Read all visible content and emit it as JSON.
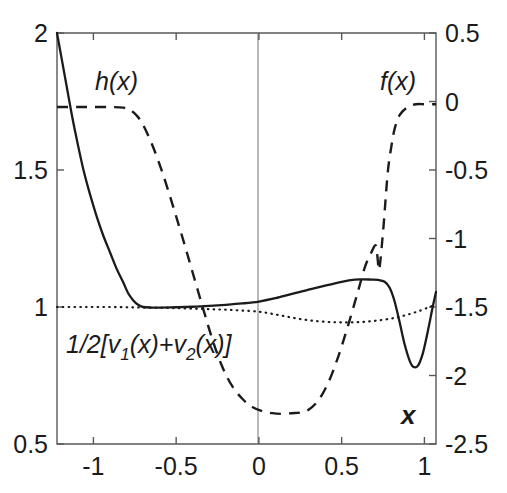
{
  "figure": {
    "background_color": "#ffffff",
    "line_color": "#1b1b1b",
    "axis_color": "#58585a",
    "width": 507,
    "height": 493
  },
  "axes": {
    "x_label": "x",
    "x_ticks": [
      "-1",
      "-0.5",
      "0",
      "0.5",
      "1"
    ],
    "x_tick_values": [
      -1,
      -0.5,
      0,
      0.5,
      1
    ],
    "x_range": [
      -1.22,
      1.07
    ],
    "left_ticks": [
      "2",
      "1.5",
      "1",
      "0.5"
    ],
    "left_tick_values": [
      2,
      1.5,
      1,
      0.5
    ],
    "left_range": [
      0.5,
      2
    ],
    "right_ticks": [
      "0.5",
      "0",
      "-0.5",
      "-1",
      "-1.5",
      "-2",
      "-2.5"
    ],
    "right_tick_values": [
      0.5,
      0,
      -0.5,
      -1,
      -1.5,
      -2,
      -2.5
    ],
    "right_range": [
      -2.5,
      0.5
    ]
  },
  "annotations": {
    "h_label": "h(x)",
    "f_label": "f(x)",
    "avg_label_prefix": "1/2[v",
    "avg_label_sub1": "1",
    "avg_label_mid": "(x)+v",
    "avg_label_sub2": "2",
    "avg_label_suffix": "(x)]"
  },
  "chart_data": {
    "type": "line",
    "title": "",
    "xlabel": "x",
    "ylabel": "",
    "xlim": [
      -1.22,
      1.07
    ],
    "ylim_left": [
      0.5,
      2.0
    ],
    "ylim_right": [
      -2.5,
      0.5
    ],
    "grid": false,
    "legend": "inline-annotations",
    "series": [
      {
        "name": "h(x)",
        "style": "solid",
        "axis": "left",
        "x": [
          -1.22,
          -1.19,
          -1.16,
          -1.13,
          -1.1,
          -1.06,
          -1.02,
          -0.98,
          -0.94,
          -0.9,
          -0.86,
          -0.82,
          -0.79,
          -0.76,
          -0.73,
          -0.7,
          -0.65,
          -0.6,
          -0.5,
          -0.4,
          -0.3,
          -0.2,
          -0.1,
          0.0,
          0.1,
          0.2,
          0.3,
          0.4,
          0.5,
          0.58,
          0.63,
          0.68,
          0.72,
          0.76,
          0.79,
          0.82,
          0.85,
          0.88,
          0.91,
          0.93,
          0.96,
          0.99,
          1.02,
          1.05,
          1.07
        ],
        "y": [
          2.0,
          1.9,
          1.8,
          1.7,
          1.61,
          1.5,
          1.41,
          1.33,
          1.26,
          1.2,
          1.14,
          1.09,
          1.05,
          1.025,
          1.008,
          1.0,
          0.998,
          0.998,
          0.999,
          1.001,
          1.004,
          1.008,
          1.013,
          1.02,
          1.032,
          1.048,
          1.063,
          1.078,
          1.092,
          1.1,
          1.101,
          1.1,
          1.099,
          1.092,
          1.07,
          1.02,
          0.945,
          0.865,
          0.805,
          0.783,
          0.785,
          0.83,
          0.91,
          1.0,
          1.055
        ]
      },
      {
        "name": "f(x)",
        "style": "dashed",
        "axis": "right",
        "x": [
          -1.22,
          -1.1,
          -1.0,
          -0.9,
          -0.82,
          -0.78,
          -0.74,
          -0.7,
          -0.64,
          -0.58,
          -0.52,
          -0.46,
          -0.4,
          -0.34,
          -0.28,
          -0.22,
          -0.16,
          -0.1,
          -0.04,
          0.02,
          0.08,
          0.14,
          0.2,
          0.25,
          0.3,
          0.36,
          0.42,
          0.48,
          0.54,
          0.6,
          0.64,
          0.68,
          0.705,
          0.715,
          0.725,
          0.735,
          0.745,
          0.755,
          0.765,
          0.78,
          0.8,
          0.82,
          0.85,
          0.9,
          0.95,
          1.0,
          1.05,
          1.07
        ],
        "y": [
          -0.04,
          -0.04,
          -0.04,
          -0.04,
          -0.045,
          -0.06,
          -0.1,
          -0.17,
          -0.33,
          -0.53,
          -0.76,
          -1.0,
          -1.25,
          -1.5,
          -1.74,
          -1.94,
          -2.08,
          -2.17,
          -2.23,
          -2.26,
          -2.275,
          -2.28,
          -2.275,
          -2.27,
          -2.25,
          -2.18,
          -2.05,
          -1.86,
          -1.63,
          -1.38,
          -1.21,
          -1.1,
          -1.05,
          -1.12,
          -1.23,
          -1.15,
          -1.02,
          -0.88,
          -0.72,
          -0.5,
          -0.33,
          -0.2,
          -0.1,
          -0.04,
          -0.02,
          -0.02,
          -0.02,
          -0.02
        ]
      },
      {
        "name": "1/2[v1(x)+v2(x)]",
        "style": "dotted",
        "axis": "left",
        "x": [
          -1.22,
          -1.1,
          -1.0,
          -0.9,
          -0.8,
          -0.7,
          -0.6,
          -0.5,
          -0.4,
          -0.3,
          -0.2,
          -0.1,
          0.0,
          0.08,
          0.16,
          0.24,
          0.32,
          0.4,
          0.48,
          0.56,
          0.64,
          0.72,
          0.8,
          0.86,
          0.92,
          0.98,
          1.03,
          1.07
        ],
        "y": [
          1.0,
          1.0,
          1.0,
          1.0,
          0.999,
          0.998,
          0.997,
          0.996,
          0.994,
          0.992,
          0.99,
          0.987,
          0.983,
          0.975,
          0.966,
          0.957,
          0.95,
          0.946,
          0.944,
          0.944,
          0.946,
          0.951,
          0.958,
          0.966,
          0.976,
          0.988,
          1.0,
          1.008
        ]
      }
    ]
  }
}
